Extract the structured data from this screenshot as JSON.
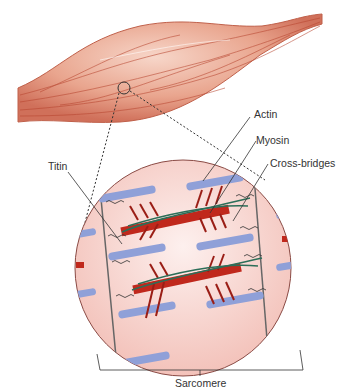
{
  "diagram": {
    "labels": {
      "actin": "Actin",
      "myosin": "Myosin",
      "cross_bridges": "Cross-bridges",
      "titin": "Titin",
      "sarcomere": "Sarcomere"
    },
    "colors": {
      "muscle": "#d9826a",
      "muscle_fiber": "#b8452f",
      "circle_fill": "#f6c9c2",
      "actin": "#8fa0d8",
      "myosin": "#c0281c",
      "cross_bridge": "#9a1e16",
      "titin_strand": "#2c6e58",
      "leader": "#333333"
    }
  }
}
